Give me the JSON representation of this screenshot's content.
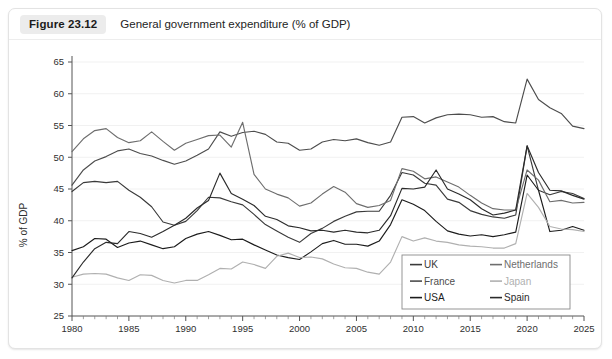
{
  "figure": {
    "number": "Figure 23.12",
    "caption": "General government expenditure (% of GDP)"
  },
  "chart_data": {
    "type": "line",
    "title": "General government expenditure (% of GDP)",
    "xlabel": "",
    "ylabel": "% of GDP",
    "xlim": [
      1980,
      2025
    ],
    "ylim": [
      25,
      65
    ],
    "yticks": [
      25,
      30,
      35,
      40,
      45,
      50,
      55,
      60,
      65
    ],
    "xticks": [
      1980,
      1985,
      1990,
      1995,
      2000,
      2005,
      2010,
      2015,
      2020,
      2025
    ],
    "xtick_minor_step": 1,
    "grid": "horizontal-light",
    "legend_position": "bottom-right",
    "x": [
      1980,
      1981,
      1982,
      1983,
      1984,
      1985,
      1986,
      1987,
      1988,
      1989,
      1990,
      1991,
      1992,
      1993,
      1994,
      1995,
      1996,
      1997,
      1998,
      1999,
      2000,
      2001,
      2002,
      2003,
      2004,
      2005,
      2006,
      2007,
      2008,
      2009,
      2010,
      2011,
      2012,
      2013,
      2014,
      2015,
      2016,
      2017,
      2018,
      2019,
      2020,
      2021,
      2022,
      2023,
      2024,
      2025
    ],
    "series": [
      {
        "name": "UK",
        "color": "#3a3a3a",
        "values": [
          44.6,
          46.0,
          46.2,
          46.0,
          46.2,
          44.8,
          43.7,
          42.2,
          39.8,
          39.3,
          39.9,
          41.6,
          43.7,
          43.6,
          43.0,
          42.5,
          41.0,
          39.4,
          38.4,
          37.4,
          36.6,
          38.0,
          38.8,
          39.9,
          40.7,
          41.4,
          41.5,
          41.5,
          44.0,
          47.6,
          47.2,
          45.9,
          45.6,
          43.4,
          42.9,
          41.6,
          41.0,
          40.6,
          40.4,
          40.9,
          51.8,
          44.8,
          44.1,
          44.6,
          44.3,
          43.5
        ]
      },
      {
        "name": "France",
        "color": "#4d4d4d",
        "values": [
          45.6,
          48.0,
          49.4,
          50.1,
          51.0,
          51.3,
          50.6,
          50.2,
          49.5,
          48.9,
          49.4,
          50.3,
          51.3,
          54.0,
          53.3,
          53.9,
          54.1,
          53.6,
          52.4,
          52.2,
          51.1,
          51.3,
          52.4,
          52.8,
          52.6,
          52.9,
          52.3,
          51.9,
          52.4,
          56.3,
          56.4,
          55.4,
          56.2,
          56.7,
          56.8,
          56.7,
          56.3,
          56.4,
          55.6,
          55.4,
          62.3,
          59.1,
          57.8,
          56.9,
          54.9,
          54.5
        ]
      },
      {
        "name": "USA",
        "color": "#1c1c1c",
        "values": [
          35.3,
          35.9,
          37.2,
          37.1,
          35.8,
          36.5,
          36.8,
          36.2,
          35.6,
          35.9,
          37.2,
          37.9,
          38.3,
          37.7,
          37.0,
          37.1,
          36.2,
          35.4,
          34.6,
          34.2,
          33.9,
          35.1,
          36.4,
          36.9,
          36.3,
          36.3,
          36.0,
          36.8,
          39.4,
          43.3,
          42.6,
          41.6,
          39.9,
          38.4,
          37.9,
          37.6,
          37.8,
          37.5,
          37.8,
          38.2,
          47.2,
          44.8,
          38.3,
          38.5,
          39.1,
          38.5
        ]
      },
      {
        "name": "Netherlands",
        "color": "#6e6e6e",
        "values": [
          50.9,
          52.9,
          54.2,
          54.5,
          53.1,
          52.3,
          52.6,
          54.0,
          52.5,
          51.1,
          52.2,
          52.8,
          53.4,
          53.5,
          51.6,
          55.5,
          47.3,
          45.0,
          44.2,
          43.6,
          42.3,
          42.8,
          44.2,
          45.4,
          44.5,
          42.7,
          42.1,
          42.4,
          43.2,
          48.2,
          47.8,
          46.6,
          46.9,
          46.1,
          45.3,
          44.0,
          42.8,
          41.9,
          41.7,
          41.7,
          48.0,
          46.4,
          43.0,
          43.2,
          42.8,
          42.9
        ]
      },
      {
        "name": "Japan",
        "color": "#b0b0b0",
        "values": [
          31.1,
          31.6,
          31.7,
          31.6,
          31.0,
          30.6,
          31.5,
          31.4,
          30.6,
          30.2,
          30.6,
          30.6,
          31.5,
          32.5,
          32.4,
          33.5,
          33.1,
          32.5,
          34.4,
          34.9,
          34.2,
          34.3,
          34.0,
          33.2,
          32.6,
          32.5,
          31.9,
          31.6,
          33.5,
          37.5,
          36.8,
          37.3,
          36.8,
          36.6,
          36.2,
          36.0,
          35.9,
          35.7,
          35.7,
          36.4,
          44.3,
          42.1,
          39.1,
          38.7,
          38.6,
          38.3
        ]
      },
      {
        "name": "Spain",
        "color": "#2b2b2b",
        "values": [
          31.0,
          33.5,
          35.6,
          36.6,
          36.4,
          38.3,
          38.0,
          37.4,
          38.3,
          39.3,
          40.4,
          42.0,
          43.2,
          47.5,
          44.3,
          43.4,
          42.4,
          40.7,
          40.2,
          39.2,
          38.9,
          38.4,
          38.5,
          38.2,
          38.5,
          38.2,
          38.1,
          38.5,
          40.8,
          45.1,
          45.0,
          45.3,
          48.0,
          45.0,
          44.2,
          43.3,
          41.9,
          40.9,
          41.2,
          41.7,
          51.8,
          47.6,
          44.8,
          44.7,
          44.0,
          43.4
        ]
      }
    ]
  },
  "legend": {
    "entries": [
      {
        "label": "UK"
      },
      {
        "label": "Netherlands"
      },
      {
        "label": "France"
      },
      {
        "label": "Japan"
      },
      {
        "label": "USA"
      },
      {
        "label": "Spain"
      }
    ]
  }
}
